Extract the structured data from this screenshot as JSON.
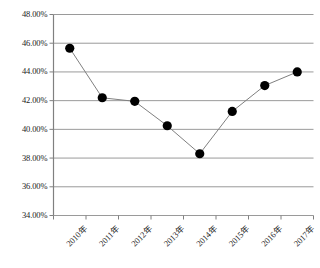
{
  "chart_data": {
    "type": "line",
    "title": "",
    "subtitle": "",
    "xlabel": "",
    "ylabel": "",
    "categories": [
      "2010年",
      "2011年",
      "2012年",
      "2013年",
      "2014年",
      "2015年",
      "2016年",
      "2017年"
    ],
    "values": [
      45.65,
      42.2,
      41.95,
      40.25,
      38.3,
      41.25,
      43.05,
      44.0
    ],
    "series": [
      {
        "name": "",
        "values": [
          45.65,
          42.2,
          41.95,
          40.25,
          38.3,
          41.25,
          43.05,
          44.0
        ]
      }
    ],
    "ylim": [
      34.0,
      48.0
    ],
    "ytick_step": 2.0,
    "ytick_labels": [
      "48.00%",
      "46.00%",
      "44.00%",
      "42.00%",
      "40.00%",
      "38.00%",
      "36.00%",
      "34.00%"
    ],
    "ytick_values": [
      48.0,
      46.0,
      44.0,
      42.0,
      40.0,
      38.0,
      36.0,
      34.0
    ],
    "value_format": "percent",
    "grid": true,
    "grid_axis": "y",
    "legend": false,
    "legend_position": "none",
    "marker": "circle-filled",
    "marker_color": "#000000",
    "line_color": "#808080",
    "grid_color": "#9a9a9a",
    "axis_color": "#808080",
    "background": "#ffffff",
    "annotations": []
  }
}
